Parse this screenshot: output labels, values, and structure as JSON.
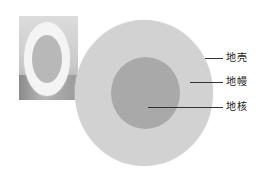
{
  "diagram": {
    "photo": {
      "subject": "egg-cross-section",
      "layers": [
        "egg-white",
        "egg-yolk"
      ]
    },
    "model": {
      "subject": "earth-structure-model"
    },
    "labels": [
      {
        "id": "crust",
        "text": "地壳",
        "color": "#d2d2d2"
      },
      {
        "id": "mantle",
        "text": "地幔",
        "color": "#d2d2d2"
      },
      {
        "id": "core",
        "text": "地核",
        "color": "#a9a9a9"
      }
    ]
  }
}
